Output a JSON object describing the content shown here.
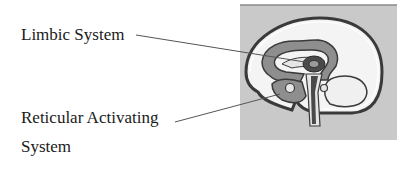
{
  "labels": {
    "limbic": "Limbic System",
    "ras_line1": "Reticular Activating",
    "ras_line2": "System"
  },
  "figure": {
    "colors": {
      "background_panel": "#c9c9c9",
      "outline": "#3a3a3a",
      "cortex_fill": "#f4f4f4",
      "limbic_fill": "#8e8e8e",
      "inner_fill": "#e6e6e6",
      "core_fill": "#4a4a4a",
      "leader_line": "#555555"
    }
  }
}
